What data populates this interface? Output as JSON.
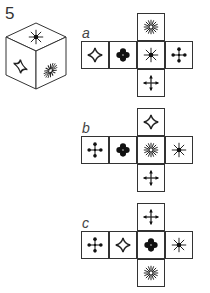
{
  "question": {
    "number": "5",
    "cube": {
      "top": "asterisk-star",
      "left": "four-point-star",
      "right": "starburst"
    }
  },
  "options": [
    {
      "label": "a",
      "faces": {
        "top": "starburst",
        "row": [
          "four-point-star",
          "clover",
          "asterisk-star",
          "dotted-cross"
        ],
        "bottom": "cross-arrows"
      }
    },
    {
      "label": "b",
      "faces": {
        "top": "four-point-star",
        "row": [
          "dotted-cross",
          "clover",
          "starburst",
          "asterisk-star"
        ],
        "bottom": "cross-arrows"
      }
    },
    {
      "label": "c",
      "faces": {
        "top": "cross-arrows",
        "row": [
          "dotted-cross",
          "four-point-star",
          "clover",
          "asterisk-star"
        ],
        "bottom": "starburst"
      }
    }
  ],
  "colors": {
    "line": "#333333",
    "background": "#ffffff"
  }
}
